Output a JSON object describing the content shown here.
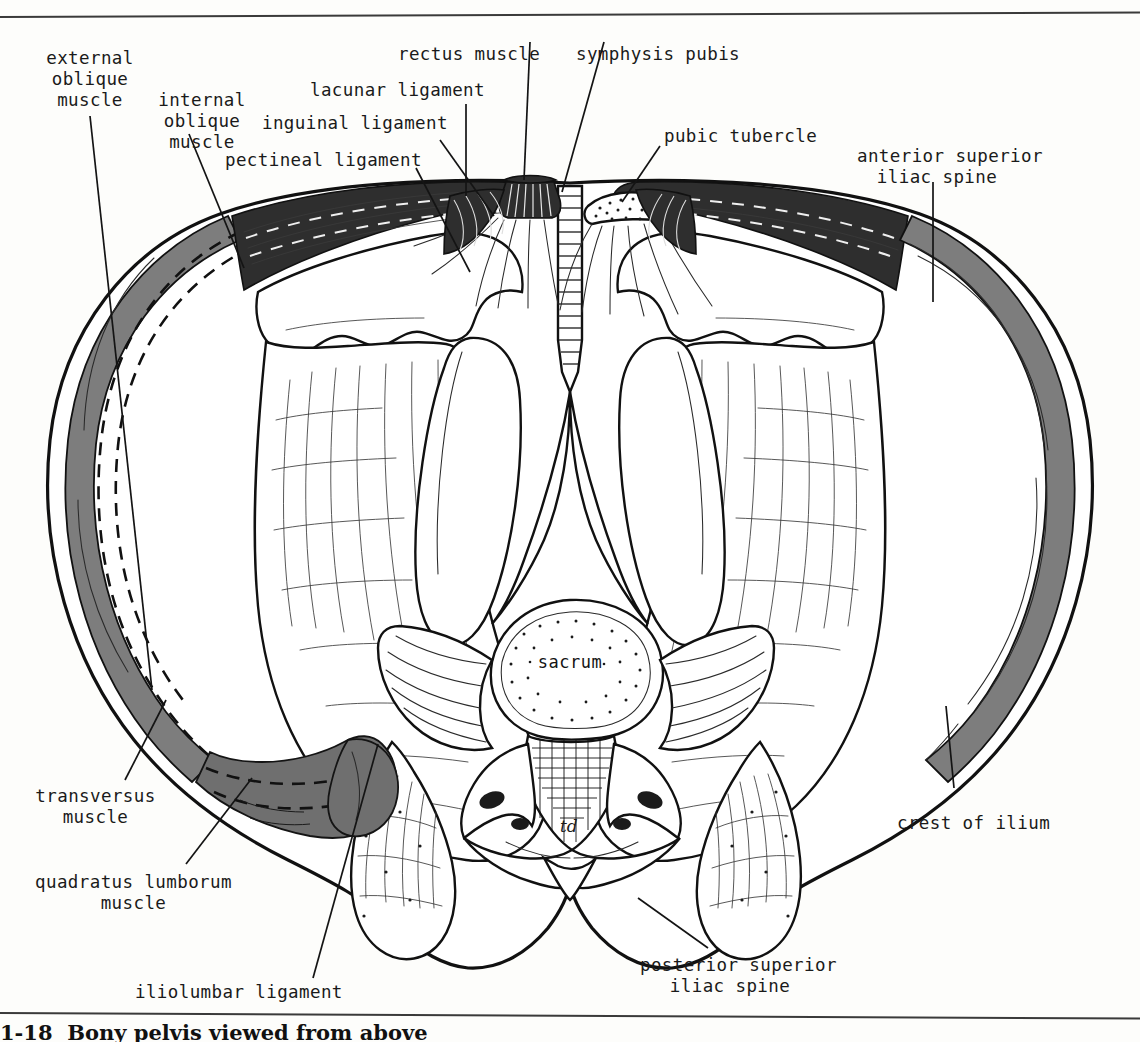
{
  "figure": {
    "type": "anatomical-illustration",
    "artist_initials": "td",
    "caption": "1-18  Bony pelvis viewed from above",
    "center_structure_label": "sacrum"
  },
  "labels": [
    {
      "id": "external-oblique-muscle",
      "text": "external\noblique\nmuscle",
      "align": "center"
    },
    {
      "id": "internal-oblique-muscle",
      "text": "internal\noblique\nmuscle",
      "align": "center"
    },
    {
      "id": "pectineal-ligament",
      "text": "pectineal ligament",
      "align": "left"
    },
    {
      "id": "inguinal-ligament",
      "text": "inguinal ligament",
      "align": "left"
    },
    {
      "id": "lacunar-ligament",
      "text": "lacunar ligament",
      "align": "left"
    },
    {
      "id": "rectus-muscle",
      "text": "rectus muscle",
      "align": "left"
    },
    {
      "id": "symphysis-pubis",
      "text": "symphysis pubis",
      "align": "left"
    },
    {
      "id": "pubic-tubercle",
      "text": "pubic tubercle",
      "align": "left"
    },
    {
      "id": "anterior-superior-iliac-spine",
      "text": "anterior superior\niliac spine",
      "align": "center"
    },
    {
      "id": "crest-of-ilium",
      "text": "crest of ilium",
      "align": "left"
    },
    {
      "id": "posterior-superior-iliac-spine",
      "text": "posterior superior\niliac spine",
      "align": "center"
    },
    {
      "id": "iliolumbar-ligament",
      "text": "iliolumbar ligament",
      "align": "left"
    },
    {
      "id": "quadratus-lumborum-muscle",
      "text": "quadratus lumborum\nmuscle",
      "align": "center"
    },
    {
      "id": "transversus-muscle",
      "text": "transversus\nmuscle",
      "align": "center"
    }
  ],
  "colors": {
    "ink": "#1a1a1a",
    "paper": "#fdfdfb",
    "muscle_gray": "#7d7d7d",
    "muscle_dark": "#2e2e2e",
    "rule": "#3a3a3a"
  }
}
